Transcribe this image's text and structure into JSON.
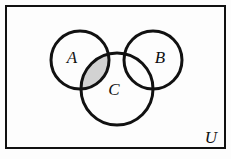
{
  "figure": {
    "kind": "venn-diagram",
    "background_color": "#fdfdfd",
    "stroke_color": "#111111",
    "shade_color": "#d2d2d2"
  },
  "universe": {
    "label": "U",
    "label_x": 211,
    "label_y": 143,
    "rect": {
      "x": 6,
      "y": 6,
      "width": 219,
      "height": 142
    },
    "border_width": 2
  },
  "sets": [
    {
      "id": "A",
      "label": "A",
      "cx": 80,
      "cy": 60,
      "r": 29,
      "label_x": 72,
      "label_y": 63,
      "stroke_width": 3
    },
    {
      "id": "B",
      "label": "B",
      "cx": 153,
      "cy": 60,
      "r": 29,
      "label_x": 160,
      "label_y": 63,
      "stroke_width": 3
    },
    {
      "id": "C",
      "label": "C",
      "cx": 117,
      "cy": 89,
      "r": 36,
      "label_x": 114,
      "label_y": 95,
      "stroke_width": 3
    }
  ],
  "shaded_regions": [
    {
      "id": "A-and-C-only",
      "description": "A intersect C, excluding B",
      "fill": "#d2d2d2"
    }
  ]
}
